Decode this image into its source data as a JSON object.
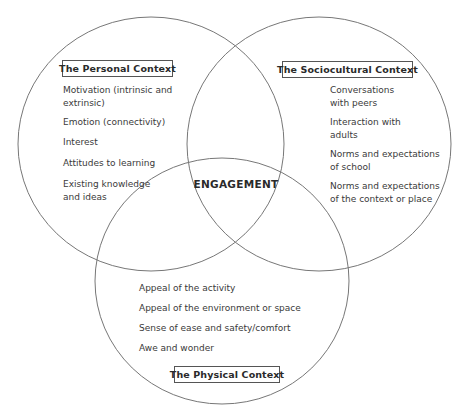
{
  "diagram": {
    "type": "venn",
    "center_label": "ENGAGEMENT",
    "colors": {
      "stroke": "#777777",
      "text": "#333333",
      "background": "#ffffff"
    },
    "sets": [
      {
        "id": "personal",
        "title": "The Personal Context",
        "items": [
          "Motivation (intrinsic and\nextrinsic)",
          "Emotion (connectivity)",
          "Interest",
          "Attitudes to learning",
          "Existing knowledge\nand ideas"
        ]
      },
      {
        "id": "sociocultural",
        "title": "The Sociocultural Context",
        "items": [
          "Conversations\nwith peers",
          "Interaction with\nadults",
          "Norms and expectations\nof school",
          "Norms and expectations\nof the context or place"
        ]
      },
      {
        "id": "physical",
        "title": "The Physical Context",
        "items": [
          "Appeal of the activity",
          "Appeal of the environment or space",
          "Sense of ease and safety/comfort",
          "Awe and wonder"
        ]
      }
    ]
  }
}
